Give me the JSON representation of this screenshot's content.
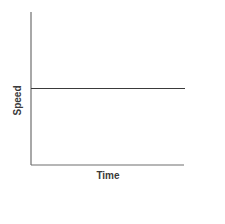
{
  "chart_data": {
    "type": "line",
    "title": "",
    "xlabel": "Time",
    "ylabel": "Speed",
    "x_ticks": [],
    "y_ticks": [],
    "xlim": [
      0,
      1
    ],
    "ylim": [
      0,
      1
    ],
    "grid": false,
    "legend": null,
    "series": [
      {
        "name": "speed",
        "x": [
          0,
          1
        ],
        "y": [
          0.5,
          0.5
        ],
        "color": "#3a3a3a"
      }
    ]
  }
}
